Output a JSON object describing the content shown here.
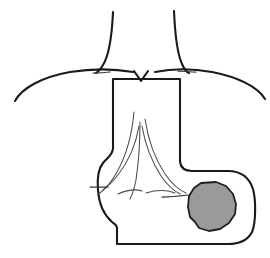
{
  "figure": {
    "canvas": {
      "width": 270,
      "height": 258,
      "background": "#ffffff"
    },
    "colors": {
      "outline": "#1a1a1a",
      "secondary_line": "#3a3a3a",
      "hair_line": "#4a4a4a",
      "lesion_fill": "#9a9a9a",
      "lesion_outline": "#1f1f1f",
      "background": "#ffffff"
    },
    "elements": [
      {
        "name": "left-upper-contour-line",
        "type": "curve",
        "path": "M 113 12 C 112 34, 110 54, 103 65 C 100 70, 98 72, 96 73",
        "style": "stroke-main"
      },
      {
        "name": "right-upper-contour-line",
        "type": "curve",
        "path": "M 174 11 C 175 34, 177 53, 182 64 C 184 69, 187 72, 189 73",
        "style": "stroke-main"
      },
      {
        "name": "left-sweeping-arc",
        "type": "curve",
        "path": "M 15 101 C 22 88, 42 77, 70 72 C 95 68, 116 69, 133 72",
        "style": "stroke-main"
      },
      {
        "name": "right-sweeping-arc",
        "type": "curve",
        "path": "M 265 99 C 258 87, 238 77, 212 72 C 190 68, 170 69, 155 72",
        "style": "stroke-main"
      },
      {
        "name": "left-short-tick",
        "type": "curve",
        "path": "M 93 73 C 98 73, 103 73, 110 72",
        "style": "stroke-thin"
      },
      {
        "name": "right-short-tick",
        "type": "curve",
        "path": "M 178 71 C 184 71, 190 72, 196 72",
        "style": "stroke-thin"
      },
      {
        "name": "v-notch-mark",
        "type": "polyline",
        "path": "M 134 71 L 141 81 L 148 71",
        "style": "stroke-main"
      },
      {
        "name": "body-outline",
        "type": "path",
        "path": "M 113 79 L 113 148 C 113 155, 107 158, 103 163 C 98 169, 97 178, 98 190 C 99 204, 104 215, 112 222 C 115 224, 117 225, 117 228 L 117 244 L 228 244 C 240 244, 248 240, 252 232 C 256 223, 256 200, 253 189 C 249 177, 240 171, 228 171 L 192 171 C 186 171, 181 169, 180 162 L 180 79 Z",
        "style": "stroke-main"
      },
      {
        "name": "fan-line-center",
        "type": "curve",
        "path": "M 140 122 C 140 140, 139 160, 136 180 C 134 190, 132 195, 130 199",
        "style": "stroke-hair"
      },
      {
        "name": "fan-line-left-inner",
        "type": "curve",
        "path": "M 139 126 C 136 144, 128 162, 118 175 C 112 183, 107 187, 103 190",
        "style": "stroke-hair"
      },
      {
        "name": "fan-line-left-outer",
        "type": "curve",
        "path": "M 134 112 C 132 134, 126 156, 117 172 C 111 183, 105 189, 100 193",
        "style": "stroke-hair"
      },
      {
        "name": "fan-line-right-inner",
        "type": "curve",
        "path": "M 142 126 C 145 144, 152 162, 161 176 C 168 186, 174 191, 180 194",
        "style": "stroke-hair"
      },
      {
        "name": "fan-line-right-outer",
        "type": "curve",
        "path": "M 145 119 C 148 139, 155 159, 165 174 C 172 184, 179 190, 186 193",
        "style": "stroke-hair"
      },
      {
        "name": "fold-line-lower-left",
        "type": "curve",
        "path": "M 118 194 C 127 190, 136 189, 142 191",
        "style": "stroke-hair"
      },
      {
        "name": "fold-line-lower-right",
        "type": "curve",
        "path": "M 146 193 C 156 190, 167 190, 175 193",
        "style": "stroke-hair"
      },
      {
        "name": "left-lateral-tick",
        "type": "curve",
        "path": "M 90 187 C 96 187, 102 187, 108 187",
        "style": "stroke-thin"
      },
      {
        "name": "right-lateral-tick",
        "type": "curve",
        "path": "M 162 197 C 172 197, 180 196, 188 195",
        "style": "stroke-thin"
      },
      {
        "name": "lesion-shaded-area",
        "type": "polygon",
        "path": "M 201 183 L 216 182 L 226 186 L 233 194 L 236 204 L 235 214 L 229 223 L 220 229 L 209 231 L 199 228 L 195 222 L 190 217 L 188 207 L 189 196 L 194 188 Z",
        "style": "lesion-shape"
      }
    ]
  }
}
